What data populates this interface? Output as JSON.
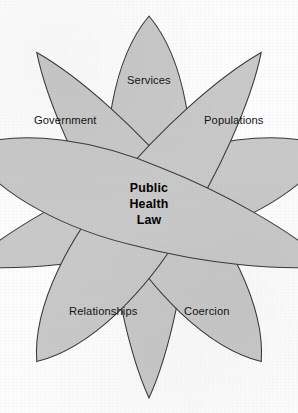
{
  "figure": {
    "type": "venn-petal-diagram",
    "center_label_lines": [
      "Public",
      "Health",
      "Law"
    ],
    "center_label_text": "Public Health Law",
    "colors": {
      "petal_fill": "#c9c9c9",
      "petal_stroke": "#3a3a3a",
      "background": "#fdfdfd",
      "text": "#141414",
      "center_text": "#000000"
    },
    "petals": [
      {
        "id": "services",
        "label": "Services",
        "rotation_deg": 0,
        "label_x": 127,
        "label_y": 74
      },
      {
        "id": "populations",
        "label": "Populations",
        "rotation_deg": 72,
        "label_x": 204,
        "label_y": 114
      },
      {
        "id": "coercion",
        "label": "Coercion",
        "rotation_deg": 144,
        "label_x": 184,
        "label_y": 305
      },
      {
        "id": "relationships",
        "label": "Relationships",
        "rotation_deg": -144,
        "label_x": 69,
        "label_y": 305
      },
      {
        "id": "government",
        "label": "Government",
        "rotation_deg": -72,
        "label_x": 34,
        "label_y": 114
      }
    ]
  }
}
